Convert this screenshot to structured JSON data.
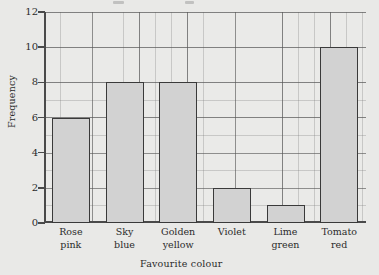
{
  "chart_data": {
    "type": "bar",
    "title": "",
    "xlabel": "Favourite colour",
    "ylabel": "Frequency",
    "categories": [
      "Rose pink",
      "Sky blue",
      "Golden yellow",
      "Violet",
      "Lime green",
      "Tomato red"
    ],
    "category_lines": [
      [
        "Rose",
        "pink"
      ],
      [
        "Sky",
        "blue"
      ],
      [
        "Golden",
        "yellow"
      ],
      [
        "Violet",
        ""
      ],
      [
        "Lime",
        "green"
      ],
      [
        "Tomato",
        "red"
      ]
    ],
    "values": [
      6,
      8,
      8,
      2,
      1,
      10
    ],
    "ylim": [
      0,
      12
    ],
    "ytick_labels": [
      "0",
      "2",
      "4",
      "6",
      "8",
      "10",
      "12"
    ],
    "ytick_values": [
      0,
      2,
      4,
      6,
      8,
      10,
      12
    ],
    "y_major_step": 2,
    "y_minor_step": 1,
    "grid": true,
    "legend": "none",
    "bar_fill": "#d2d2d2",
    "bar_edge": "#3a3a3a",
    "axis_color": "#4a4a4a",
    "background": "#e9e9e7",
    "grid_major_color": "#555555",
    "grid_minor_color": "#787878"
  }
}
